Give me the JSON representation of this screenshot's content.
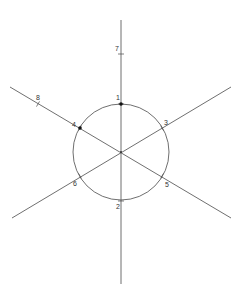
{
  "diagram": {
    "type": "geometric-construction",
    "stroke_color": "#4a4a4a",
    "center": {
      "x": 121,
      "y": 152
    },
    "circle": {
      "cx": 121,
      "cy": 152,
      "r": 48
    },
    "lines": [
      {
        "name": "vertical-line",
        "x1": 121,
        "y1": 20,
        "x2": 121,
        "y2": 284
      },
      {
        "name": "diagonal-line-descending",
        "x1": 10,
        "y1": 87,
        "x2": 231,
        "y2": 218
      },
      {
        "name": "diagonal-line-ascending",
        "x1": 12,
        "y1": 218,
        "x2": 231,
        "y2": 87
      }
    ],
    "points": [
      {
        "label": "1",
        "x": 121,
        "y": 104,
        "dot": true,
        "lx": 116,
        "ly": 100
      },
      {
        "label": "2",
        "x": 121,
        "y": 201,
        "dot": false,
        "lx": 116,
        "ly": 209
      },
      {
        "label": "3",
        "x": 162,
        "y": 128,
        "dot": false,
        "lx": 164,
        "ly": 125
      },
      {
        "label": "4",
        "x": 80,
        "y": 128,
        "dot": true,
        "lx": 72,
        "ly": 127
      },
      {
        "label": "5",
        "x": 162,
        "y": 176,
        "dot": false,
        "lx": 165,
        "ly": 187
      },
      {
        "label": "6",
        "x": 80,
        "y": 176,
        "dot": false,
        "lx": 73,
        "ly": 186
      },
      {
        "label": "7",
        "x": 121,
        "y": 54,
        "dot": false,
        "lx": 115,
        "ly": 51
      },
      {
        "label": "8",
        "x": 38,
        "y": 104,
        "dot": false,
        "lx": 36,
        "ly": 100
      }
    ]
  }
}
